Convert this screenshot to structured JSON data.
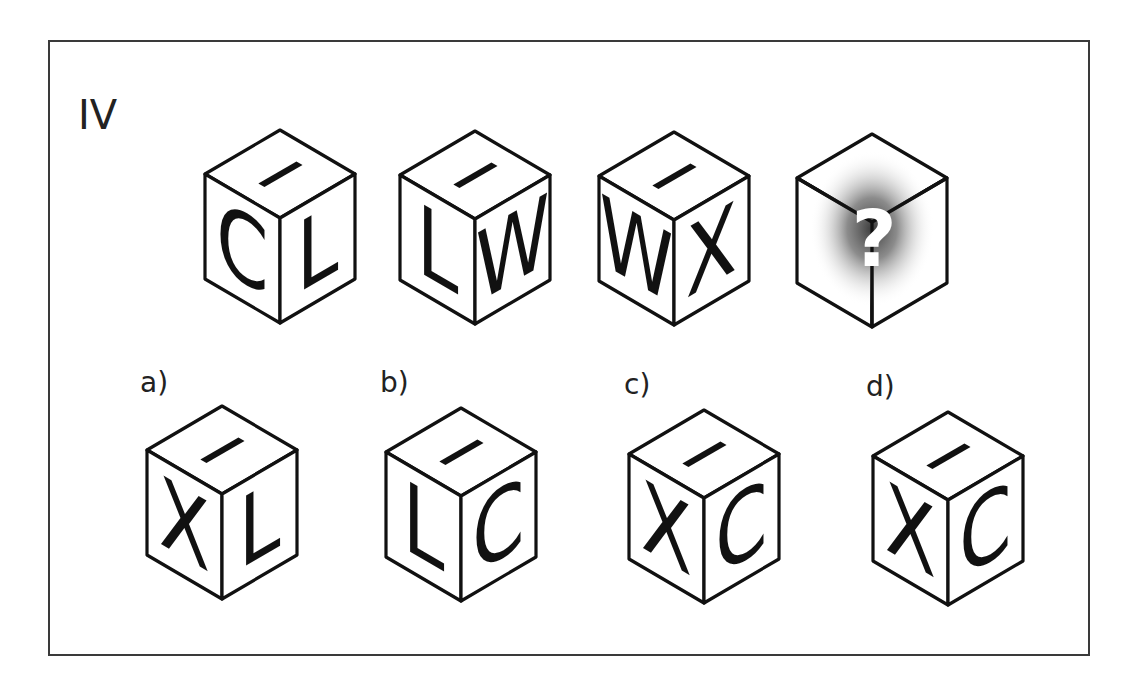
{
  "puzzle": {
    "label": "IV",
    "sequence": [
      {
        "id": "cube-1",
        "top": "I",
        "left": "C",
        "right": "L"
      },
      {
        "id": "cube-2",
        "top": "I",
        "left": "L",
        "right": "W"
      },
      {
        "id": "cube-3",
        "top": "I",
        "left": "W",
        "right": "X"
      },
      {
        "id": "cube-4",
        "unknown": true,
        "symbol": "?"
      }
    ],
    "options": [
      {
        "label": "a)",
        "top": "I",
        "left": "X",
        "right": "L"
      },
      {
        "label": "b)",
        "top": "I",
        "left": "L",
        "right": "C"
      },
      {
        "label": "c)",
        "top": "I",
        "left": "X",
        "right": "C"
      },
      {
        "label": "d)",
        "top": "I",
        "left": "X",
        "right": "C"
      }
    ]
  },
  "colors": {
    "stroke": "#111111",
    "frame": "#3a3a3a",
    "background": "#ffffff",
    "question_glow": "#555555"
  }
}
